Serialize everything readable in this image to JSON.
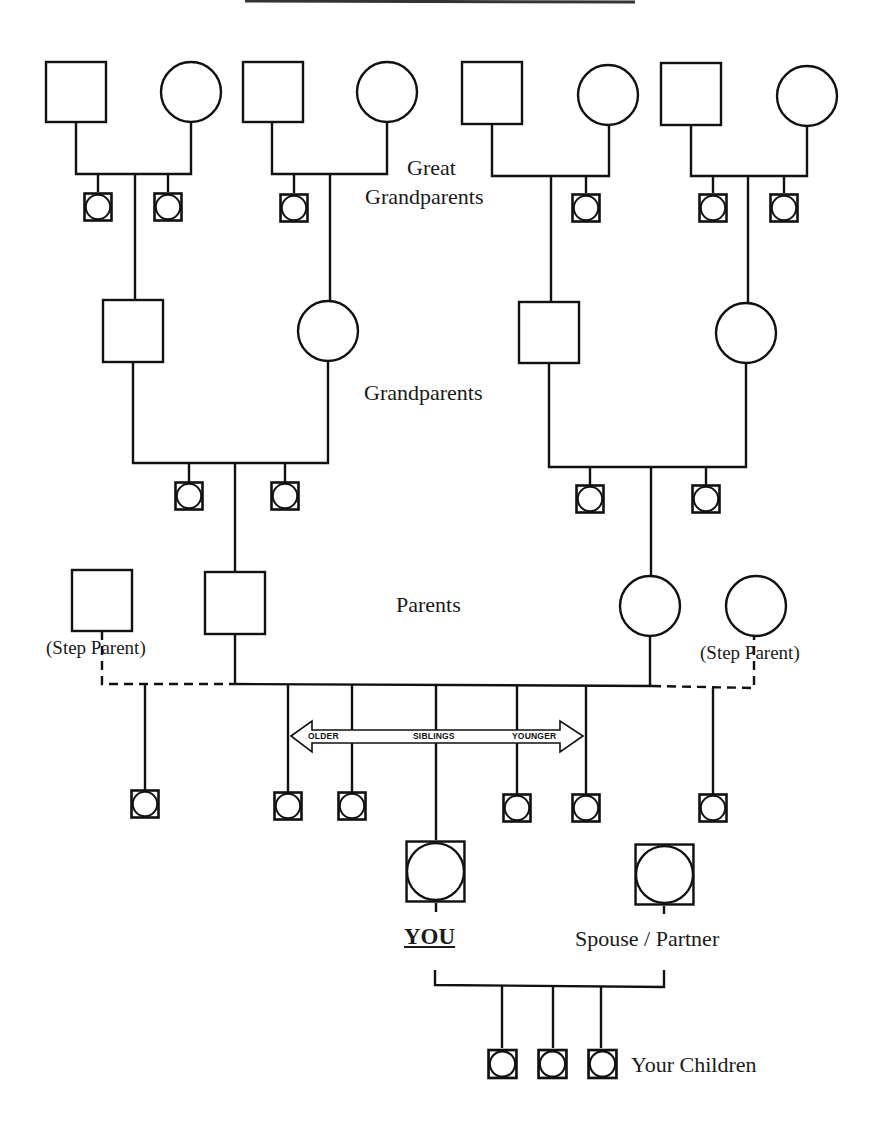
{
  "generations": {
    "great_grandparents": {
      "label_line1": "Great",
      "label_line2": "Grandparents"
    },
    "grandparents": {
      "label": "Grandparents"
    },
    "parents": {
      "label": "Parents"
    }
  },
  "step_parents": {
    "left_label": "(Step Parent)",
    "right_label": "(Step Parent)"
  },
  "siblings_arrow": {
    "left": "OLDER",
    "middle": "SIBLINGS",
    "right": "YOUNGER"
  },
  "self": {
    "label": "YOU"
  },
  "spouse": {
    "label": "Spouse / Partner"
  },
  "children": {
    "label": "Your Children",
    "count": 3
  },
  "symbols": {
    "male": "square",
    "female": "circle",
    "unknown_sex": "circle inside square"
  },
  "colors": {
    "line": "#111111",
    "background": "#ffffff"
  }
}
